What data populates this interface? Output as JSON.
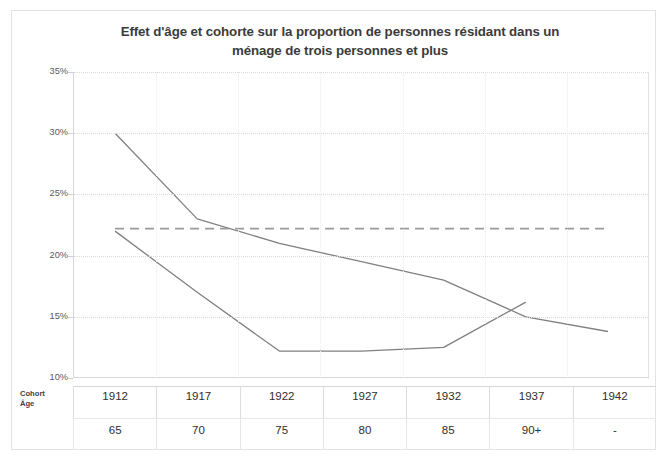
{
  "chart_data": {
    "type": "line",
    "title": "Effet d'âge et cohorte sur la proportion de personnes résidant dans un ménage de trois personnes et plus",
    "title_line1": "Effet d'âge et cohorte sur la proportion de personnes résidant dans un",
    "title_line2": "ménage de trois personnes et plus",
    "xlabel": "",
    "ylabel": "Proportion 3+",
    "ylim": [
      10,
      35
    ],
    "yticks": [
      35,
      30,
      25,
      20,
      15,
      10
    ],
    "ytick_labels": [
      "35%",
      "30%",
      "25%",
      "20%",
      "15%",
      "10%"
    ],
    "grid": true,
    "legend": "none",
    "categories": [
      "1912",
      "1917",
      "1922",
      "1927",
      "1932",
      "1937",
      "1942"
    ],
    "series": [
      {
        "name": "Effet d'âge",
        "style": "solid",
        "color": "#808080",
        "values": [
          30.0,
          23.0,
          21.0,
          19.5,
          18.0,
          15.0,
          13.8
        ]
      },
      {
        "name": "Référence",
        "style": "dashed",
        "color": "#9a9a9a",
        "values": [
          22.2,
          22.2,
          22.2,
          22.2,
          22.2,
          22.2,
          22.2
        ]
      },
      {
        "name": "Effet de cohorte",
        "style": "solid",
        "color": "#808080",
        "values": [
          22.0,
          17.0,
          12.2,
          12.2,
          12.5,
          16.2,
          null
        ]
      }
    ]
  },
  "table": {
    "row_labels": {
      "cohort": "Cohort",
      "age": "Âge"
    },
    "cohort_values": [
      "1912",
      "1917",
      "1922",
      "1927",
      "1932",
      "1937",
      "1942"
    ],
    "age_values": [
      "65",
      "70",
      "75",
      "80",
      "85",
      "90+",
      "-"
    ]
  },
  "colors": {
    "line": "#808080",
    "dashed_line": "#9a9a9a",
    "grid": "#d9d9d9",
    "axis": "#d8d8d8",
    "title_text": "#3b3b3b",
    "tick_text": "#595959",
    "frame": "#e3e3e3"
  }
}
